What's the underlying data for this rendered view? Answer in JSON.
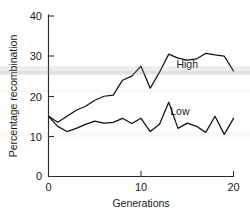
{
  "chart_data": {
    "type": "line",
    "title": "",
    "subtitle": "",
    "xlabel": "Generations",
    "ylabel": "Percentage recombination",
    "xlim": [
      0,
      20
    ],
    "ylim": [
      0,
      40
    ],
    "xticks": [
      0,
      10,
      20
    ],
    "xticklabels": [
      "0",
      "10",
      "20"
    ],
    "yticks": [
      0,
      10,
      20,
      30,
      40
    ],
    "yticklabels": [
      "0",
      "10",
      "20",
      "30",
      "40"
    ],
    "grid": false,
    "legend_position": "inline-annotation",
    "x": [
      0,
      1,
      2,
      3,
      4,
      5,
      6,
      7,
      8,
      9,
      10,
      11,
      12,
      13,
      14,
      15,
      16,
      17,
      18,
      19,
      20
    ],
    "series": [
      {
        "name": "High",
        "color": "#111111",
        "label_x": 15.0,
        "label_y": 27.0,
        "values": [
          15.0,
          13.5,
          15.0,
          16.5,
          17.5,
          19.0,
          20.0,
          20.3,
          24.0,
          25.0,
          27.5,
          22.0,
          26.0,
          30.5,
          29.5,
          29.0,
          29.3,
          30.7,
          30.3,
          30.0,
          26.3
        ]
      },
      {
        "name": "Low",
        "color": "#111111",
        "label_x": 14.2,
        "label_y": 15.3,
        "values": [
          15.0,
          12.5,
          11.2,
          12.0,
          13.0,
          13.8,
          13.3,
          13.5,
          14.5,
          13.2,
          14.5,
          11.2,
          13.0,
          18.5,
          12.0,
          13.3,
          12.5,
          11.0,
          15.0,
          10.5,
          14.5
        ]
      }
    ]
  },
  "axes": {
    "y_title": "Percentage recombination",
    "x_title": "Generations",
    "y_tick_labels": [
      "40",
      "30",
      "20",
      "10",
      "0"
    ],
    "x_tick_labels": [
      "0",
      "10",
      "20"
    ]
  },
  "annotations": {
    "high_label": "High",
    "low_label": "Low"
  },
  "colors": {
    "line": "#111111",
    "axis": "#2b2b2b",
    "background": "#ffffff",
    "text": "#1a1a1a"
  }
}
